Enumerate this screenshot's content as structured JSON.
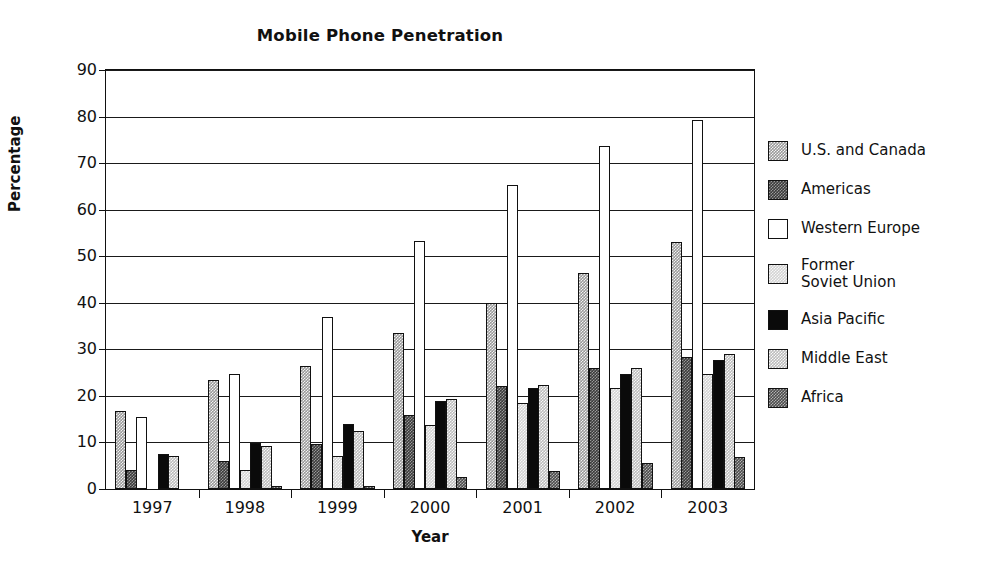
{
  "chart_data": {
    "type": "bar",
    "title": "Mobile Phone Penetration",
    "xlabel": "Year",
    "ylabel": "Percentage",
    "categories": [
      "1997",
      "1998",
      "1999",
      "2000",
      "2001",
      "2002",
      "2003"
    ],
    "ylim": [
      0,
      90
    ],
    "yticks": [
      0,
      10,
      20,
      30,
      40,
      50,
      60,
      70,
      80,
      90
    ],
    "grid": true,
    "legend_position": "right",
    "series": [
      {
        "name": "U.S. and Canada",
        "pattern": "p-uscanada",
        "swatch_color": "#9a9a9a",
        "values": [
          16.8,
          23.5,
          26.5,
          33.5,
          40.0,
          46.3,
          53.0
        ]
      },
      {
        "name": "Americas",
        "pattern": "p-americas",
        "swatch_color": "#3b3b3b",
        "values": [
          4.0,
          6.0,
          9.7,
          15.8,
          22.2,
          26.0,
          28.3
        ]
      },
      {
        "name": "Western Europe",
        "pattern": "p-westeurope",
        "swatch_color": "#ffffff",
        "values": [
          15.5,
          24.8,
          37.0,
          53.2,
          65.3,
          73.7,
          79.3
        ]
      },
      {
        "name": "Former\nSoviet Union",
        "pattern": "p-fsu",
        "swatch_color": "#d3d3d3",
        "values": [
          0.0,
          4.0,
          7.0,
          13.8,
          18.5,
          21.8,
          24.7
        ]
      },
      {
        "name": "Asia Pacific",
        "pattern": "p-asiapacific",
        "swatch_color": "#0a0a0a",
        "values": [
          7.6,
          9.8,
          13.9,
          18.8,
          21.6,
          24.7,
          27.8
        ]
      },
      {
        "name": "Middle East",
        "pattern": "p-middleeast",
        "swatch_color": "#bcbcbc",
        "values": [
          7.0,
          9.2,
          12.5,
          19.4,
          22.3,
          26.0,
          29.0
        ]
      },
      {
        "name": "Africa",
        "pattern": "p-africa",
        "swatch_color": "#4d4d4d",
        "values": [
          0.0,
          0.7,
          0.7,
          2.5,
          3.8,
          5.5,
          6.8
        ]
      }
    ]
  }
}
